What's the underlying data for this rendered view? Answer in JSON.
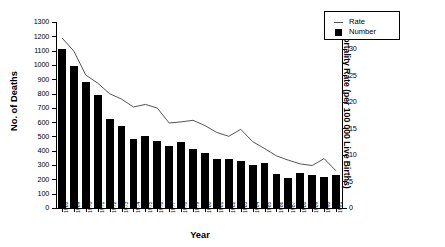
{
  "chart_data": {
    "type": "bar",
    "title": "",
    "xlabel": "Year",
    "ylabel": "No. of Deaths",
    "y2label": "Mortality Rate (per 100 000 Live Births)",
    "grid": false,
    "legend_position": "top-right",
    "ylim": [
      0,
      1300
    ],
    "y2lim": [
      0,
      35
    ],
    "yticks": [
      0,
      100,
      200,
      300,
      400,
      500,
      600,
      700,
      800,
      900,
      1000,
      1100,
      1200,
      1300
    ],
    "y2ticks": [
      0,
      5,
      10,
      15,
      20,
      25,
      30,
      35
    ],
    "categories": [
      "1968",
      "1969",
      "1970",
      "1971",
      "1972",
      "1973",
      "1974",
      "1975",
      "1976",
      "1977",
      "1978",
      "1979",
      "1980",
      "1981",
      "1982",
      "1983",
      "1984",
      "1985",
      "1986",
      "1987",
      "1988",
      "1989",
      "1990",
      "1991"
    ],
    "series": [
      {
        "name": "Number",
        "type": "bar",
        "axis": "left",
        "color": "#000000",
        "values": [
          1110,
          990,
          880,
          790,
          620,
          575,
          480,
          500,
          465,
          430,
          462,
          415,
          388,
          345,
          340,
          330,
          300,
          318,
          238,
          207,
          248,
          232,
          218,
          232
        ]
      },
      {
        "name": "Rate",
        "type": "line",
        "axis": "right",
        "color": "#555555",
        "values": [
          32.0,
          29.5,
          25.0,
          23.5,
          21.5,
          20.5,
          19.0,
          19.5,
          18.8,
          16.0,
          16.2,
          16.5,
          15.5,
          14.2,
          13.5,
          14.8,
          12.5,
          11.2,
          9.8,
          9.0,
          8.3,
          8.0,
          9.3,
          7.0
        ]
      }
    ]
  },
  "legend": {
    "items": [
      {
        "label": "Rate",
        "marker": "line"
      },
      {
        "label": "Number",
        "marker": "square"
      }
    ]
  }
}
